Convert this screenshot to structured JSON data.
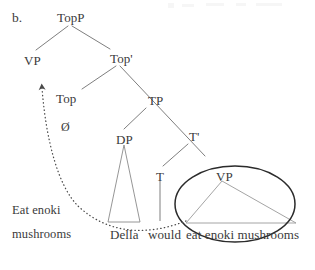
{
  "figure": {
    "panel_label": "b.",
    "caption_left_line1": "Eat enoki",
    "caption_left_line2": "mushrooms"
  },
  "tree": {
    "nodes": [
      {
        "id": "TopP",
        "label": "TopP",
        "x": 57,
        "y": 11
      },
      {
        "id": "VPtop",
        "label": "VP",
        "x": 24,
        "y": 54
      },
      {
        "id": "Topbar",
        "label": "Top'",
        "x": 110,
        "y": 52
      },
      {
        "id": "Top",
        "label": "Top",
        "x": 56,
        "y": 92
      },
      {
        "id": "null",
        "label": "Ø",
        "x": 61,
        "y": 121
      },
      {
        "id": "TP",
        "label": "TP",
        "x": 148,
        "y": 94
      },
      {
        "id": "DP",
        "label": "DP",
        "x": 116,
        "y": 133
      },
      {
        "id": "Tbar",
        "label": "T'",
        "x": 189,
        "y": 130
      },
      {
        "id": "T",
        "label": "T",
        "x": 156,
        "y": 170
      },
      {
        "id": "VPbot",
        "label": "VP",
        "x": 216,
        "y": 170
      }
    ],
    "terminals": [
      {
        "id": "della",
        "label": "Della",
        "x": 110,
        "y": 228
      },
      {
        "id": "would",
        "label": "would",
        "x": 148,
        "y": 228
      },
      {
        "id": "vpspan",
        "label": "eat enoki mushrooms",
        "x": 186,
        "y": 228
      }
    ]
  },
  "annotations": {
    "movement_arrow_name": "movement-arrow",
    "circle_name": "vp-highlight-ellipse"
  },
  "colors": {
    "ink": "#3a3a3a",
    "line": "#6f6f6f",
    "triangle": "#8a8a8a",
    "circle": "#2b2b2b",
    "background": "#ffffff"
  }
}
